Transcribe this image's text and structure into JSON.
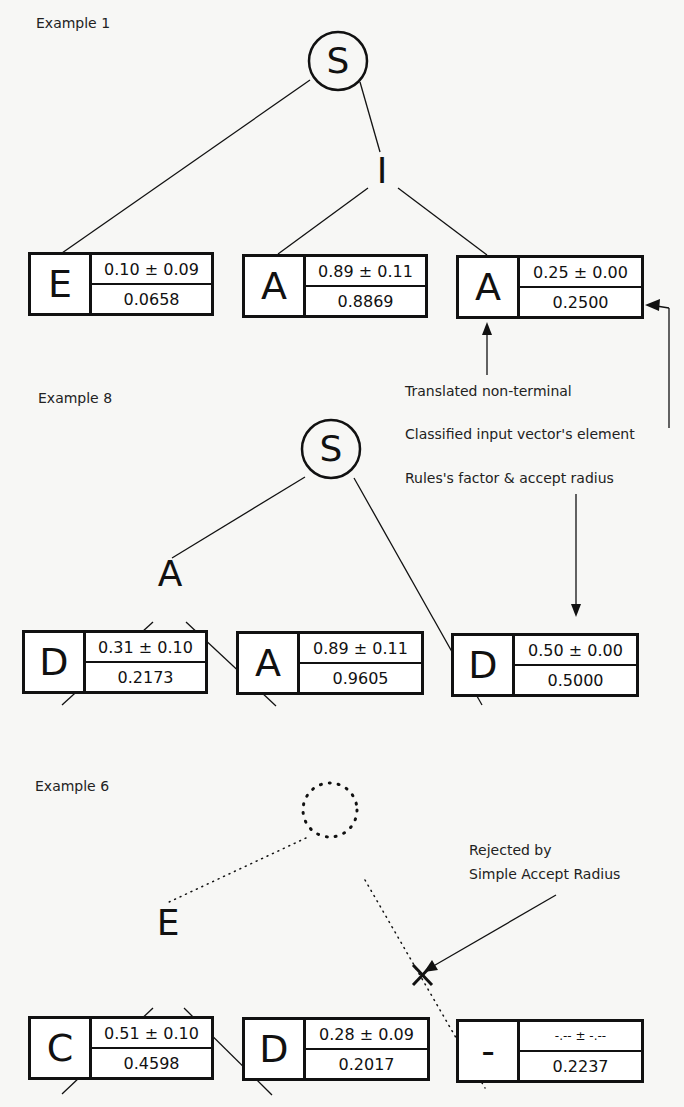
{
  "examples": [
    {
      "title": "Example 1",
      "root": "S",
      "inner": [
        {
          "label": "I"
        }
      ],
      "leaves": [
        {
          "symbol": "E",
          "factor_radius": "0.10 ± 0.09",
          "input": "0.0658"
        },
        {
          "symbol": "A",
          "factor_radius": "0.89 ± 0.11",
          "input": "0.8869"
        },
        {
          "symbol": "A",
          "factor_radius": "0.25 ± 0.00",
          "input": "0.2500"
        }
      ]
    },
    {
      "title": "Example 8",
      "root": "S",
      "inner": [
        {
          "label": "A"
        }
      ],
      "leaves": [
        {
          "symbol": "D",
          "factor_radius": "0.31 ± 0.10",
          "input": "0.2173"
        },
        {
          "symbol": "A",
          "factor_radius": "0.89 ± 0.11",
          "input": "0.9605"
        },
        {
          "symbol": "D",
          "factor_radius": "0.50 ± 0.00",
          "input": "0.5000"
        }
      ]
    },
    {
      "title": "Example 6",
      "root": "",
      "inner": [
        {
          "label": "E"
        }
      ],
      "leaves": [
        {
          "symbol": "C",
          "factor_radius": "0.51 ± 0.10",
          "input": "0.4598"
        },
        {
          "symbol": "D",
          "factor_radius": "0.28 ± 0.09",
          "input": "0.2017"
        },
        {
          "symbol": "-",
          "factor_radius": "-.-- ± -.--",
          "input": "0.2237"
        }
      ]
    }
  ],
  "legend": {
    "translated_non_terminal": "Translated non-terminal",
    "classified_input": "Classified input vector's element",
    "rules_factor": "Rules's factor & accept radius"
  },
  "rejected_note": {
    "line1": "Rejected by",
    "line2": "Simple Accept Radius",
    "marker": "×"
  },
  "colors": {
    "ink": "#111111",
    "background": "#f7f7f5"
  }
}
